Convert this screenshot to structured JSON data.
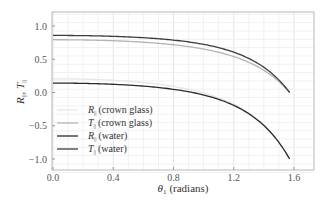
{
  "chart_data": {
    "type": "line",
    "title": "",
    "xlabel": "θ1 (radians)",
    "ylabel": "R∥, T∥",
    "xlim": [
      0.0,
      1.62
    ],
    "ylim": [
      -1.2,
      1.2
    ],
    "xticks": [
      0.0,
      0.4,
      0.8,
      1.2,
      1.6
    ],
    "xtick_labels": [
      "0.0",
      "0.4",
      "0.8",
      "1.2",
      "1.6"
    ],
    "yticks": [
      -1.0,
      -0.5,
      0.0,
      0.5,
      1.0
    ],
    "ytick_labels": [
      "−1.0",
      "−0.5",
      "0.0",
      "0.5",
      "1.0"
    ],
    "grid": true,
    "legend_position": "lower left",
    "series": [
      {
        "name": "R∥ (crown glass)",
        "n": 1.52,
        "kind": "R",
        "color": "#e6e6e6",
        "x": [
          0.0,
          0.2,
          0.4,
          0.6,
          0.8,
          1.0,
          1.2,
          1.4,
          1.5,
          1.5708
        ],
        "values": [
          -0.206,
          -0.202,
          -0.187,
          -0.157,
          -0.101,
          -0.006,
          0.175,
          0.513,
          0.734,
          1.0
        ]
      },
      {
        "name": "T∥ (crown glass)",
        "n": 1.52,
        "kind": "T",
        "color": "#b4b4b4",
        "x": [
          0.0,
          0.2,
          0.4,
          0.6,
          0.8,
          1.0,
          1.2,
          1.4,
          1.5,
          1.5708
        ],
        "values": [
          0.794,
          0.792,
          0.785,
          0.771,
          0.744,
          0.698,
          0.614,
          0.435,
          0.261,
          0.0
        ]
      },
      {
        "name": "R∥ (water)",
        "n": 1.33,
        "kind": "R",
        "color": "#2a2a2a",
        "x": [
          0.0,
          0.2,
          0.4,
          0.6,
          0.8,
          1.0,
          1.2,
          1.4,
          1.5,
          1.5708
        ],
        "values": [
          0.142,
          0.139,
          0.128,
          0.107,
          0.069,
          0.003,
          -0.127,
          -0.421,
          -0.656,
          -1.0
        ]
      },
      {
        "name": "T∥ (water)",
        "n": 1.33,
        "kind": "T",
        "color": "#3c3c3c",
        "x": [
          0.0,
          0.2,
          0.4,
          0.6,
          0.8,
          1.0,
          1.2,
          1.4,
          1.5,
          1.5708
        ],
        "values": [
          0.858,
          0.856,
          0.851,
          0.84,
          0.818,
          0.779,
          0.703,
          0.52,
          0.33,
          0.0
        ]
      }
    ]
  },
  "legend": {
    "items": [
      {
        "symbol": "R",
        "sub": "||",
        "text": "(crown glass)"
      },
      {
        "symbol": "T",
        "sub": "||",
        "text": "(crown glass)"
      },
      {
        "symbol": "R",
        "sub": "||",
        "text": "(water)"
      },
      {
        "symbol": "T",
        "sub": "||",
        "text": "(water)"
      }
    ]
  },
  "axes": {
    "x_symbol": "θ",
    "x_sub": "1",
    "x_unit": "(radians)",
    "y_r": "R",
    "y_t": "T",
    "y_sub": "||"
  }
}
